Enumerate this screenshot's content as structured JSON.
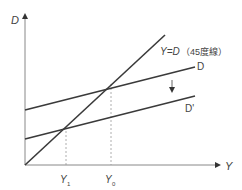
{
  "diagram": {
    "axes": {
      "y_label": "D",
      "x_label": "Y"
    },
    "lines": {
      "forty_five": {
        "label": "Y=D",
        "note": "（45度線）"
      },
      "d": {
        "label": "D"
      },
      "d_prime": {
        "label": "D'"
      }
    },
    "ticks": {
      "y1": {
        "main": "Y",
        "sub": "1"
      },
      "y0": {
        "main": "Y",
        "sub": "0"
      }
    },
    "colors": {
      "line": "#3a3a3a",
      "axis": "#777777",
      "dotted": "#999999",
      "text": "#444444"
    }
  }
}
